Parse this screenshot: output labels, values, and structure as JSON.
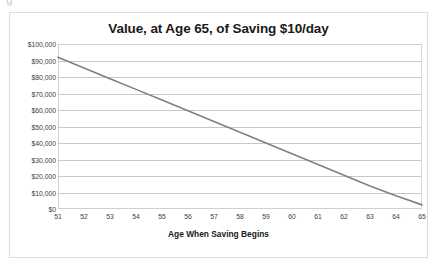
{
  "artifact": {
    "clipped_text": "g"
  },
  "chart": {
    "title": "Value, at Age 65, of Saving $10/day",
    "x_axis_title": "Age When Saving Begins",
    "line_color": "#808080",
    "gridline_color": "#c8c8c8",
    "border_color": "#dedede",
    "text_color": "#1a1a1a"
  },
  "chart_data": {
    "type": "line",
    "title": "Value, at Age 65, of Saving $10/day",
    "xlabel": "Age When Saving Begins",
    "ylabel": "",
    "categories": [
      51,
      52,
      53,
      54,
      55,
      56,
      57,
      58,
      59,
      60,
      61,
      62,
      63,
      64,
      65
    ],
    "x_tick_labels": [
      "51",
      "52",
      "53",
      "54",
      "55",
      "56",
      "57",
      "58",
      "59",
      "60",
      "61",
      "62",
      "63",
      "64",
      "65"
    ],
    "y_tick_labels": [
      "$100,000",
      "$90,000",
      "$80,000",
      "$70,000",
      "$60,000",
      "$50,000",
      "$40,000",
      "$30,000",
      "$20,000",
      "$10,000",
      "$0"
    ],
    "y_tick_values": [
      100000,
      90000,
      80000,
      70000,
      60000,
      50000,
      40000,
      30000,
      20000,
      10000,
      0
    ],
    "ylim": [
      0,
      100000
    ],
    "xlim": [
      51,
      65
    ],
    "grid": "horizontal",
    "legend": "none",
    "series": [
      {
        "name": "Value at Age 65",
        "values": [
          92000,
          85500,
          79000,
          72500,
          66000,
          59500,
          53000,
          46500,
          40000,
          33500,
          27000,
          20500,
          14000,
          8000,
          2500
        ]
      }
    ]
  }
}
